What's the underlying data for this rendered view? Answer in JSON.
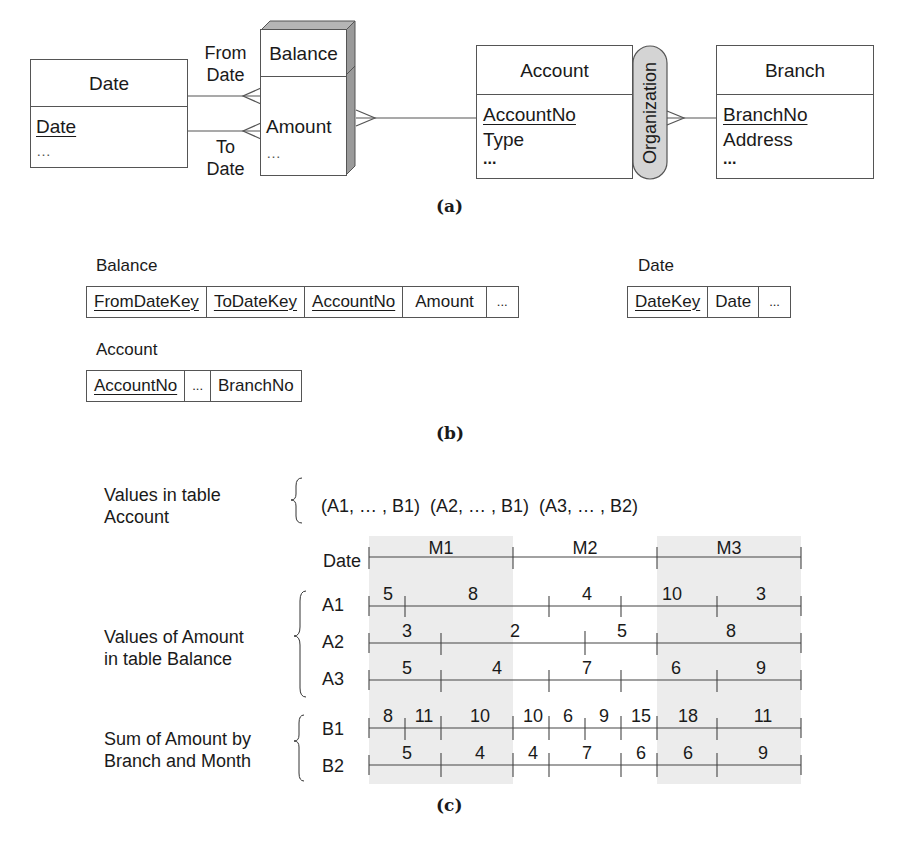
{
  "panel_a": {
    "caption": "(a)",
    "entities": {
      "date": {
        "title": "Date",
        "attributes": [
          {
            "label": "Date",
            "key": true
          },
          {
            "label": "…",
            "key": false
          }
        ]
      },
      "balance": {
        "title": "Balance",
        "attributes": [
          {
            "label": "Amount",
            "key": false
          },
          {
            "label": "…",
            "key": false
          }
        ]
      },
      "account": {
        "title": "Account",
        "attributes": [
          {
            "label": "AccountNo",
            "key": true
          },
          {
            "label": "Type",
            "key": false
          },
          {
            "label": "...",
            "key": false
          }
        ]
      },
      "branch": {
        "title": "Branch",
        "attributes": [
          {
            "label": "BranchNo",
            "key": true
          },
          {
            "label": "Address",
            "key": false
          },
          {
            "label": "...",
            "key": false
          }
        ]
      }
    },
    "roles": {
      "from_date_1": "From",
      "from_date_2": "Date",
      "to_date_1": "To",
      "to_date_2": "Date"
    },
    "hierarchy": {
      "label": "Organization"
    }
  },
  "panel_b": {
    "caption": "(b)",
    "tables": {
      "balance": {
        "name": "Balance",
        "columns": [
          "FromDateKey",
          "ToDateKey",
          "AccountNo",
          "Amount",
          "..."
        ]
      },
      "date": {
        "name": "Date",
        "columns": [
          "DateKey",
          "Date",
          "..."
        ]
      },
      "account": {
        "name": "Account",
        "columns": [
          "AccountNo",
          "...",
          "BranchNo"
        ]
      }
    }
  },
  "panel_c": {
    "caption": "(c)",
    "account_values_label_1": "Values in table",
    "account_values_label_2": "Account",
    "account_values": "(A1, … , B1)  (A2, … , B1)  (A3, … , B2)",
    "date_label": "Date",
    "months": [
      "M1",
      "M2",
      "M3"
    ],
    "balance_label_1": "Values of Amount",
    "balance_label_2": "in table Balance",
    "sum_label_1": "Sum of Amount by",
    "sum_label_2": "Branch and Month",
    "rows": {
      "A1": {
        "label": "A1",
        "values": [
          "5",
          "8",
          "4",
          "10",
          "3"
        ]
      },
      "A2": {
        "label": "A2",
        "values": [
          "3",
          "2",
          "5",
          "8"
        ]
      },
      "A3": {
        "label": "A3",
        "values": [
          "5",
          "4",
          "7",
          "6",
          "9"
        ]
      },
      "B1": {
        "label": "B1",
        "values": [
          "8",
          "11",
          "10",
          "10",
          "6",
          "9",
          "15",
          "18",
          "11"
        ]
      },
      "B2": {
        "label": "B2",
        "values": [
          "5",
          "4",
          "4",
          "7",
          "6",
          "6",
          "9"
        ]
      }
    }
  },
  "colors": {
    "line": "#555555",
    "shade": "#ececec",
    "box_side": "#9a9a9a",
    "box_top": "#b5b5b5",
    "pill": "#d4d4d4"
  }
}
